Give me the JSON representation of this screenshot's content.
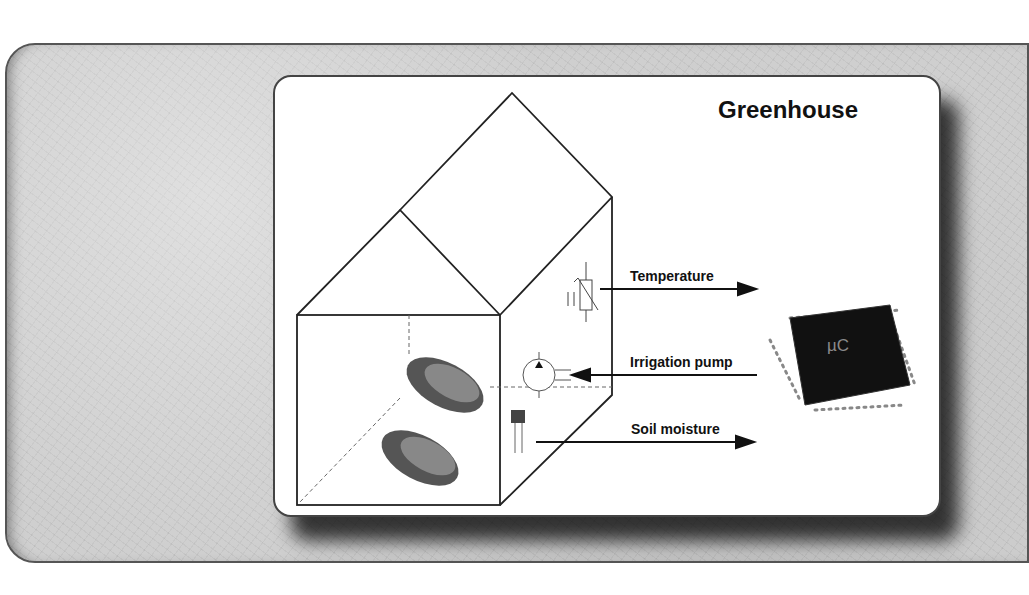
{
  "diagram": {
    "title": "Greenhouse",
    "signals": [
      {
        "label": "Temperature",
        "direction": "out",
        "sensor": "thermistor-icon"
      },
      {
        "label": "Irrigation pump",
        "direction": "in",
        "actuator": "pump-icon"
      },
      {
        "label": "Soil moisture",
        "direction": "out",
        "sensor": "moisture-sensor-icon"
      }
    ],
    "controller": {
      "label": "µC",
      "icon": "microcontroller-chip-icon"
    },
    "plants": [
      "lettuce-icon",
      "lettuce-icon"
    ],
    "colors": {
      "background_paper": "#cfcfcf",
      "card": "#ffffff",
      "lines": "#222222",
      "chip": "#111111"
    }
  }
}
